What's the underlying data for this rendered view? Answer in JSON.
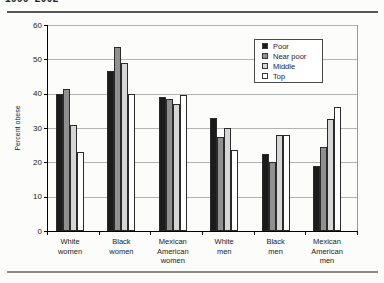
{
  "header": {
    "clipped_title": "1999–2002"
  },
  "chart_data": {
    "type": "bar",
    "title": "1999–2002",
    "ylabel": "Percent obese",
    "xlabel": "",
    "ylim": [
      0,
      60
    ],
    "yticks": [
      0,
      10,
      20,
      30,
      40,
      50,
      60
    ],
    "grid": true,
    "legend_position": "top-right",
    "categories": [
      "White women",
      "Black women",
      "Mexican American women",
      "White men",
      "Black men",
      "Mexican American men"
    ],
    "category_label_lines": [
      [
        "White",
        "women"
      ],
      [
        "Black",
        "women"
      ],
      [
        "Mexican",
        "American",
        "women"
      ],
      [
        "White",
        "men"
      ],
      [
        "Black",
        "men"
      ],
      [
        "Mexican",
        "American",
        "men"
      ]
    ],
    "series": [
      {
        "name": "Poor",
        "color": "#1b1b1b",
        "values": [
          40,
          46.5,
          39,
          33,
          22.5,
          19
        ]
      },
      {
        "name": "Near poor",
        "color": "#909090",
        "values": [
          41.5,
          53.5,
          38.5,
          27.5,
          20,
          24.5
        ]
      },
      {
        "name": "Middle",
        "color": "#d6d6d6",
        "values": [
          31,
          49,
          37,
          30,
          28,
          32.5
        ]
      },
      {
        "name": "Top",
        "color": "#ffffff",
        "values": [
          23,
          40,
          39.5,
          23.5,
          28,
          36
        ]
      }
    ],
    "colors": {
      "axis": "#000000",
      "gridline": "#b2b2b2",
      "legend_border": "#4a4a4a"
    }
  }
}
